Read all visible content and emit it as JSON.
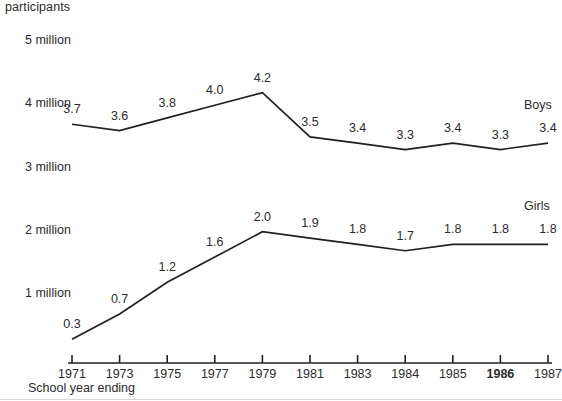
{
  "chart_data": {
    "type": "line",
    "title": "participants",
    "xlabel": "School year ending",
    "ylabel": "participants",
    "categories": [
      "1971",
      "1973",
      "1975",
      "1977",
      "1979",
      "1981",
      "1983",
      "1984",
      "1985",
      "1986",
      "1987"
    ],
    "x_tick_emphasis": [
      "1986"
    ],
    "ylim": [
      0,
      5
    ],
    "y_tick_labels": [
      "5 million",
      "4 million",
      "3 million",
      "2 million",
      "1 million"
    ],
    "y_tick_values": [
      5,
      4,
      3,
      2,
      1
    ],
    "grid": false,
    "legend_position": "inline-right",
    "series": [
      {
        "name": "Boys",
        "values": [
          3.7,
          3.6,
          3.8,
          4.0,
          4.2,
          3.5,
          3.4,
          3.3,
          3.4,
          3.3,
          3.4
        ],
        "labels": [
          "3.7",
          "3.6",
          "3.8",
          "4.0",
          "4.2",
          "3.5",
          "3.4",
          "3.3",
          "3.4",
          "3.3",
          "3.4"
        ],
        "color": "#231f20"
      },
      {
        "name": "Girls",
        "values": [
          0.3,
          0.7,
          1.2,
          1.6,
          2.0,
          1.9,
          1.8,
          1.7,
          1.8,
          1.8,
          1.8
        ],
        "labels": [
          "0.3",
          "0.7",
          "1.2",
          "1.6",
          "2.0",
          "1.9",
          "1.8",
          "1.7",
          "1.8",
          "1.8",
          "1.8"
        ],
        "color": "#231f20"
      }
    ]
  },
  "axis": {
    "y_title": "participants",
    "x_caption": "School year ending"
  },
  "legend": {
    "boys": "Boys",
    "girls": "Girls"
  },
  "colors": {
    "ink": "#231f20",
    "background": "#ffffff"
  }
}
